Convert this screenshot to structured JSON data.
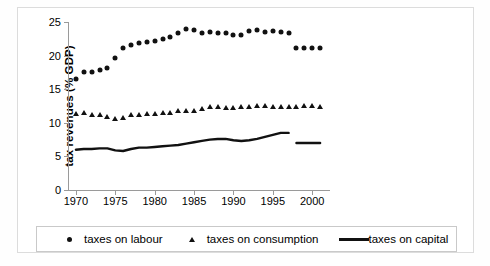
{
  "chart_data": {
    "type": "scatter",
    "title": "",
    "xlabel": "",
    "ylabel": "tax revenues (% GDP)",
    "xlim": [
      1969,
      2002
    ],
    "ylim": [
      0,
      25
    ],
    "yticks": [
      0,
      5,
      10,
      15,
      20,
      25
    ],
    "xticks": [
      1970,
      1975,
      1980,
      1985,
      1990,
      1995,
      2000
    ],
    "grid": false,
    "legend_position": "bottom",
    "x": [
      1970,
      1971,
      1972,
      1973,
      1974,
      1975,
      1976,
      1977,
      1978,
      1979,
      1980,
      1981,
      1982,
      1983,
      1984,
      1985,
      1986,
      1987,
      1988,
      1989,
      1990,
      1991,
      1992,
      1993,
      1994,
      1995,
      1996,
      1997,
      1998,
      1999,
      2000,
      2001
    ],
    "series": [
      {
        "name": "taxes on labour",
        "marker": "circle",
        "color": "#111111",
        "values": [
          16.5,
          17.6,
          17.6,
          17.8,
          18.2,
          19.6,
          21.2,
          21.6,
          21.9,
          22.0,
          22.2,
          22.4,
          22.7,
          23.4,
          23.9,
          23.8,
          23.4,
          23.5,
          23.4,
          23.3,
          23.0,
          23.0,
          23.6,
          23.8,
          23.5,
          23.6,
          23.5,
          23.4,
          21.1,
          21.1,
          21.1,
          21.1
        ],
        "break_after_year": 1997
      },
      {
        "name": "taxes on consumption",
        "marker": "triangle",
        "color": "#111111",
        "values": [
          11.3,
          11.4,
          11.2,
          11.1,
          10.8,
          10.6,
          10.7,
          11.1,
          11.1,
          11.3,
          11.3,
          11.4,
          11.5,
          11.7,
          11.8,
          11.8,
          12.1,
          12.3,
          12.3,
          12.2,
          12.2,
          12.3,
          12.3,
          12.5,
          12.5,
          12.4,
          12.4,
          12.4,
          12.4,
          12.5,
          12.5,
          12.4
        ]
      },
      {
        "name": "taxes on capital",
        "marker": "line",
        "color": "#111111",
        "values": [
          6.0,
          6.1,
          6.1,
          6.2,
          6.2,
          5.9,
          5.8,
          6.1,
          6.3,
          6.3,
          6.4,
          6.5,
          6.6,
          6.7,
          6.9,
          7.1,
          7.3,
          7.5,
          7.6,
          7.6,
          7.4,
          7.3,
          7.4,
          7.6,
          7.9,
          8.2,
          8.5,
          8.5,
          7.0,
          7.0,
          7.0,
          7.0
        ],
        "break_after_year": 1997
      }
    ]
  },
  "legend": {
    "items": [
      {
        "label": "taxes on labour",
        "symbol": "circle-marker"
      },
      {
        "label": "taxes on consumption",
        "symbol": "triangle-marker"
      },
      {
        "label": "taxes on capital",
        "symbol": "line-marker"
      }
    ]
  }
}
